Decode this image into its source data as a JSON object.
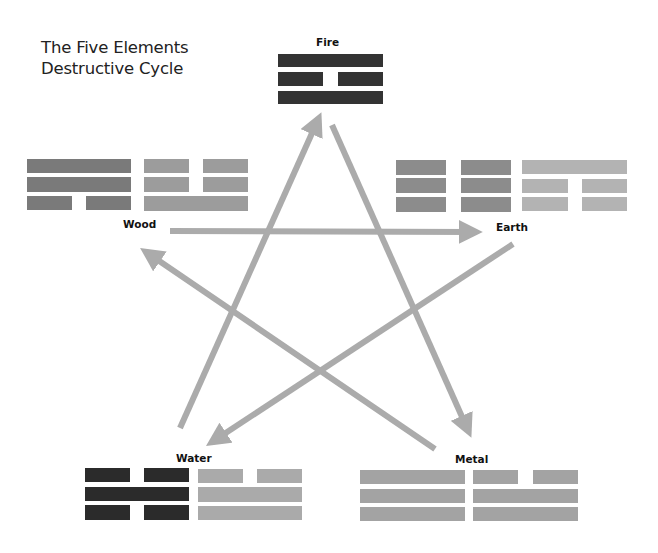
{
  "title": {
    "line1": "The Five Elements",
    "line2": "Destructive Cycle"
  },
  "colors": {
    "arrow": "#ababab",
    "fire": "#333333",
    "wood_dark": "#7a7a7a",
    "wood_light": "#9c9c9c",
    "earth_dark": "#8c8c8c",
    "earth_light": "#b3b3b3",
    "water_dark": "#2b2b2b",
    "water_light": "#aaaaaa",
    "metal": "#a3a3a3"
  },
  "elements": [
    {
      "name": "Fire",
      "trigrams": [
        {
          "lines": [
            "solid",
            "broken",
            "solid"
          ]
        }
      ]
    },
    {
      "name": "Wood",
      "trigrams": [
        {
          "lines": [
            "solid",
            "solid",
            "broken"
          ]
        },
        {
          "lines": [
            "broken",
            "broken",
            "solid"
          ]
        }
      ]
    },
    {
      "name": "Earth",
      "trigrams": [
        {
          "lines": [
            "broken",
            "broken",
            "broken"
          ]
        },
        {
          "lines": [
            "solid",
            "broken",
            "broken"
          ]
        }
      ]
    },
    {
      "name": "Water",
      "trigrams": [
        {
          "lines": [
            "broken",
            "solid",
            "broken"
          ]
        },
        {
          "lines": [
            "broken",
            "solid",
            "solid"
          ]
        }
      ]
    },
    {
      "name": "Metal",
      "trigrams": [
        {
          "lines": [
            "solid",
            "solid",
            "solid"
          ]
        },
        {
          "lines": [
            "broken",
            "solid",
            "solid"
          ]
        }
      ]
    }
  ],
  "arrows": [
    {
      "from": "Wood",
      "to": "Earth",
      "x1": 170,
      "y1": 231,
      "x2": 480,
      "y2": 232
    },
    {
      "from": "Earth",
      "to": "Water",
      "x1": 513,
      "y1": 244,
      "x2": 208,
      "y2": 444
    },
    {
      "from": "Water",
      "to": "Fire",
      "x1": 180,
      "y1": 428,
      "x2": 320,
      "y2": 115
    },
    {
      "from": "Fire",
      "to": "Metal",
      "x1": 332,
      "y1": 125,
      "x2": 470,
      "y2": 435
    },
    {
      "from": "Metal",
      "to": "Wood",
      "x1": 435,
      "y1": 449,
      "x2": 142,
      "y2": 250
    }
  ]
}
